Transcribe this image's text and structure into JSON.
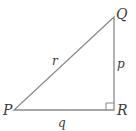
{
  "diagram": {
    "type": "right-triangle",
    "vertices": {
      "P": {
        "label": "P",
        "x": 14,
        "y": 110
      },
      "Q": {
        "label": "Q",
        "x": 114,
        "y": 17
      },
      "R": {
        "label": "R",
        "x": 114,
        "y": 110
      }
    },
    "sides": {
      "r": {
        "label": "r",
        "from": "P",
        "to": "Q"
      },
      "p": {
        "label": "p",
        "from": "Q",
        "to": "R"
      },
      "q": {
        "label": "q",
        "from": "P",
        "to": "R"
      }
    },
    "right_angle_at": "R",
    "stroke_color": "#8a8a8a",
    "label_color": "#3a3a3a"
  }
}
